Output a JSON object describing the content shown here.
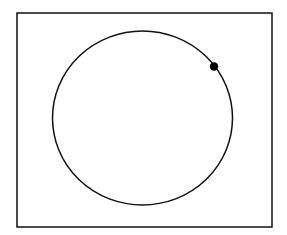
{
  "diagram": {
    "background_color": "#ffffff",
    "stroke_color": "#111111",
    "point_color": "#000000",
    "shapes": [
      {
        "kind": "frame",
        "label": ""
      },
      {
        "kind": "circle",
        "label": ""
      },
      {
        "kind": "point",
        "label": "",
        "position_on_circle_deg": 42
      }
    ]
  }
}
